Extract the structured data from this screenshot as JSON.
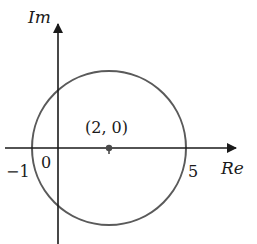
{
  "diagram": {
    "type": "complex-plane-circle",
    "axes": {
      "x_label": "Re",
      "y_label": "Im"
    },
    "ticks": {
      "origin": "0",
      "left_intercept": "−1",
      "right_intercept": "5"
    },
    "center_point": {
      "label": "(2, 0)",
      "re": 2,
      "im": 0
    },
    "circle": {
      "center_re": 2,
      "center_im": 0,
      "radius": 3
    },
    "colors": {
      "axis": "#1a1a1a",
      "circle": "#5a5a5a",
      "point": "#4a4a4a",
      "text": "#1a1a1a"
    }
  }
}
